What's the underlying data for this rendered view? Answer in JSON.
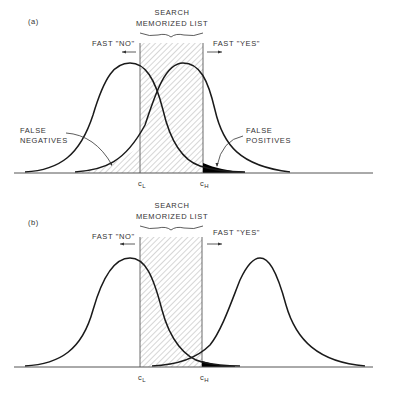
{
  "panels": [
    {
      "id": "a",
      "label": "(a)",
      "header_line1": "SEARCH",
      "header_line2": "MEMORIZED LIST",
      "fast_no": "FAST \"NO\"",
      "fast_yes": "FAST \"YES\"",
      "false_negatives_line1": "FALSE",
      "false_negatives_line2": "NEGATIVES",
      "false_positives_line1": "FALSE",
      "false_positives_line2": "POSITIVES",
      "criterion_low": "c",
      "criterion_low_sub": "L",
      "criterion_high": "c",
      "criterion_high_sub": "H"
    },
    {
      "id": "b",
      "label": "(b)",
      "header_line1": "SEARCH",
      "header_line2": "MEMORIZED LIST",
      "fast_no": "FAST \"NO\"",
      "fast_yes": "FAST \"YES\"",
      "criterion_low": "c",
      "criterion_low_sub": "L",
      "criterion_high": "c",
      "criterion_high_sub": "H"
    }
  ],
  "colors": {
    "curve": "#1a1a1a",
    "hatch": "#777777",
    "false_region": "#000000",
    "background": "#ffffff"
  }
}
